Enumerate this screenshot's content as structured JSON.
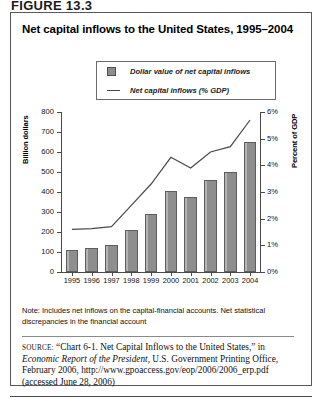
{
  "figure_number": "FIGURE 13.3",
  "chart_title": "Net capital inflows to the United States, 1995–2004",
  "legend": {
    "bar_label": "Dollar value of net capital inflows",
    "line_label": "Net capital inflows (% GDP)",
    "bar_swatch_icon": "square-swatch-icon",
    "line_swatch_icon": "line-swatch-icon"
  },
  "note": "Note: Includes net inflows on the capital-financial accounts. Net statistical discrepancies in the financial account",
  "source": {
    "label": "SOURCE:",
    "text_1": "“Chart 6-1. Net Capital Inflows to the United States,” in",
    "italic_title": "Economic Report of the President",
    "text_2": ", U.S. Government Printing Office, February 2006, http://www.gpoaccess.gov/eop/2006/2006_erp.pdf (accessed June 28, 2006)"
  },
  "chart_data": {
    "type": "bar",
    "title": "Net capital inflows to the United States, 1995–2004",
    "categories": [
      "1995",
      "1996",
      "1997",
      "1998",
      "1999",
      "2000",
      "2001",
      "2002",
      "2003",
      "2004"
    ],
    "xlabel": "",
    "ylabel": "Billion dollars",
    "y2label": "Percent of GDP",
    "ylim": [
      0,
      800
    ],
    "y2lim": [
      0,
      6
    ],
    "yticks": [
      "0",
      "100",
      "200",
      "300",
      "400",
      "500",
      "600",
      "700",
      "800"
    ],
    "y2ticks": [
      "0%",
      "1%",
      "2%",
      "3%",
      "4%",
      "5%",
      "6%"
    ],
    "grid": false,
    "legend_position": "top-center",
    "series": [
      {
        "name": "Dollar value of net capital inflows",
        "type": "bar",
        "axis": "left",
        "unit": "billion dollars",
        "color": "#8e8e8e",
        "values": [
          112,
          122,
          136,
          208,
          292,
          405,
          375,
          458,
          502,
          650
        ]
      },
      {
        "name": "Net capital inflows (% GDP)",
        "type": "line",
        "axis": "right",
        "unit": "percent of GDP",
        "color": "#4a4a4a",
        "values": [
          1.6,
          1.63,
          1.7,
          2.5,
          3.3,
          4.3,
          3.9,
          4.5,
          4.7,
          5.7
        ]
      }
    ]
  }
}
